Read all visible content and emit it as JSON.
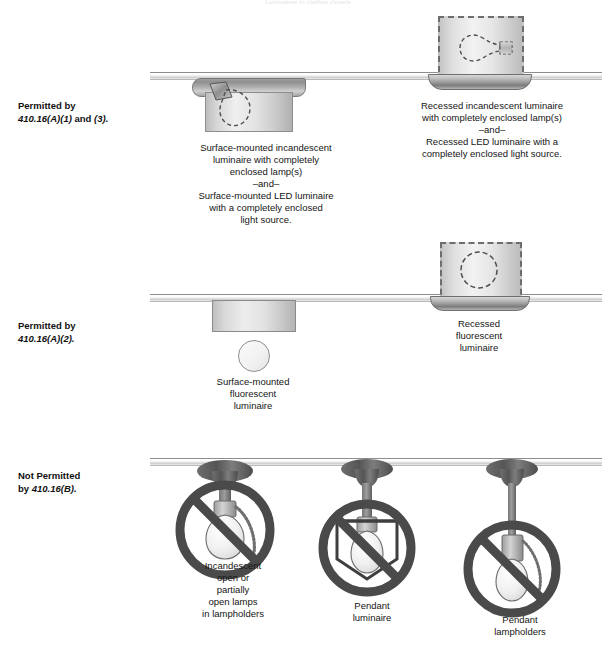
{
  "page": {
    "faded_title": "Luminaires in clothes closets",
    "width": 616,
    "height": 654,
    "background": "#ffffff",
    "ink": "#1a1a1a",
    "prohibition_color": "#4a4a4a"
  },
  "rows": [
    {
      "id": "permitted-a1-a3",
      "label_line1": "Permitted by",
      "label_code": "410.16(A)(1)",
      "label_mid": " and ",
      "label_code2": "(3).",
      "items": [
        {
          "id": "surface-mounted-incandescent",
          "caption": "Surface-mounted incandescent\nluminaire with completely\nenclosed lamp(s)\n–and–\nSurface-mounted LED luminaire\nwith a completely enclosed\nlight source.",
          "mount": "surface",
          "lamp": "incandescent"
        },
        {
          "id": "recessed-incandescent",
          "caption": "Recessed incandescent luminaire\nwith completely enclosed lamp(s)\n–and–\nRecessed LED luminaire with a\ncompletely enclosed light source.",
          "mount": "recessed",
          "lamp": "incandescent"
        }
      ]
    },
    {
      "id": "permitted-a2",
      "label_line1": "Permitted by",
      "label_code": "410.16(A)(2).",
      "label_mid": "",
      "label_code2": "",
      "items": [
        {
          "id": "surface-mounted-fluorescent",
          "caption": "Surface-mounted\nfluorescent\nluminaire",
          "mount": "surface",
          "lamp": "fluorescent"
        },
        {
          "id": "recessed-fluorescent",
          "caption": "Recessed\nfluorescent\nluminaire",
          "mount": "recessed",
          "lamp": "fluorescent"
        }
      ]
    },
    {
      "id": "not-permitted-b",
      "label_line1": "Not Permitted",
      "label_pre": "by ",
      "label_code": "410.16(B).",
      "label_mid": "",
      "label_code2": "",
      "items": [
        {
          "id": "incandescent-open-lamps",
          "caption": "Incandescent\nopen or\npartially\nopen lamps\nin lampholders",
          "prohibited": true
        },
        {
          "id": "pendant-luminaire",
          "caption": "Pendant\nluminaire",
          "prohibited": true
        },
        {
          "id": "pendant-lampholders",
          "caption": "Pendant\nlampholders",
          "prohibited": true
        }
      ]
    }
  ]
}
